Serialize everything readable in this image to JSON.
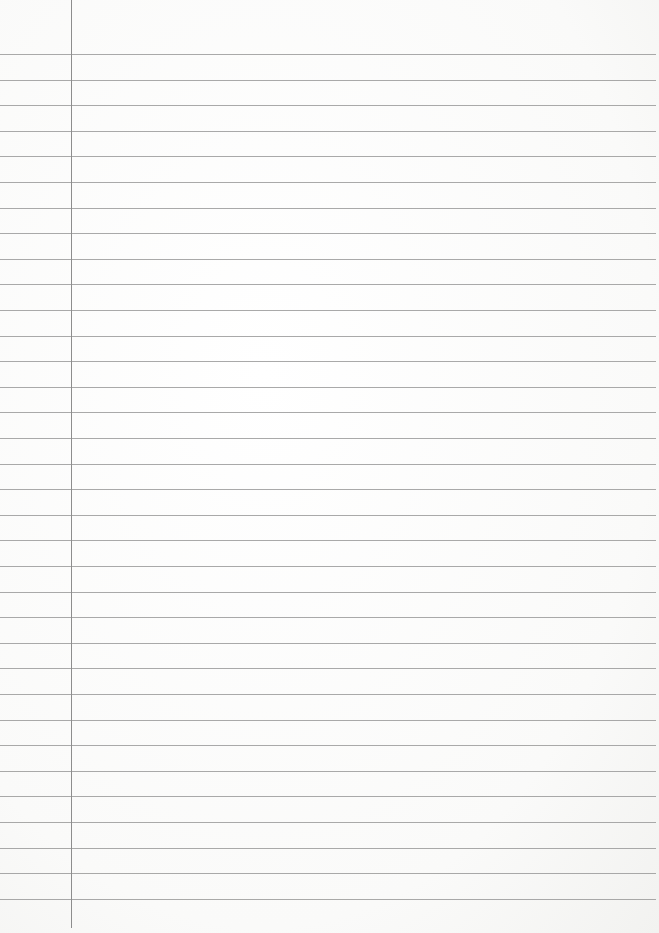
{
  "paper": {
    "type": "lined-notebook-paper",
    "width": 659,
    "height": 933,
    "background_color": "#fbfbfa",
    "rule_color": "#9a9a9a",
    "margin_color": "#8d8d8d",
    "rule_count": 34,
    "first_rule_y": 54,
    "rule_spacing": 25.6,
    "rule_right_end_x": 656,
    "margin_x": 71,
    "margin_bottom_y": 928
  }
}
